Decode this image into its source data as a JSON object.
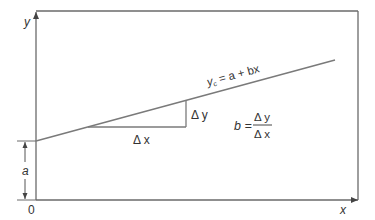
{
  "diagram": {
    "axes": {
      "x_label": "x",
      "y_label": "y",
      "origin_label": "0"
    },
    "regression_line": {
      "equation_prefix": "y",
      "equation_subscript": "c",
      "equation_rest": " = a + bx",
      "color": "#7a7a7a"
    },
    "intercept": {
      "label": "a"
    },
    "slope_triangle": {
      "delta_x_label": "Δ x",
      "delta_y_label": "Δ y"
    },
    "slope_formula": {
      "lhs": "b =",
      "numerator": "Δ y",
      "denominator": "Δ x"
    },
    "colors": {
      "frame": "#6a6a6a",
      "line": "#7a7a7a",
      "text": "#333333",
      "background": "#ffffff"
    }
  }
}
